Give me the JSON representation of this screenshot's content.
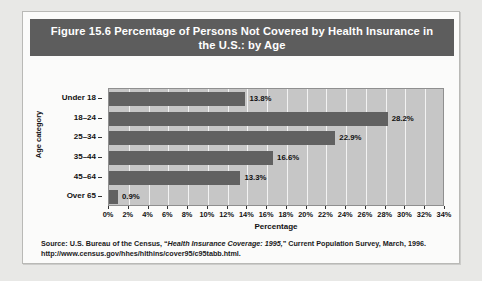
{
  "figure": {
    "title": "Figure 15.6  Percentage of Persons Not Covered by Health Insurance in the U.S.: by Age"
  },
  "source": {
    "prefix": "Source: U.S. Bureau of the Census, “",
    "italic": "Health Insurance Coverage: 1995,",
    "suffix": "” Current Population Survey, March, 1996.",
    "url": "http://www.census.gov/hhes/hlthins/cover95/c95tabb.html."
  },
  "colors": {
    "title_banner": "#5d5d5d",
    "bar": "#616161",
    "plot_background": "#c6c6c6",
    "gridline": "#f2f2f2",
    "panel_background": "#fbfbfa",
    "page_background": "#e8e8e6"
  },
  "chart_data": {
    "type": "bar",
    "orientation": "horizontal",
    "title": "Figure 15.6  Percentage of Persons Not Covered by Health Insurance in the U.S.: by Age",
    "xlabel": "Percentage",
    "ylabel": "Age category",
    "categories": [
      "Under 18",
      "18–24",
      "25–34",
      "35–44",
      "45–64",
      "Over 65"
    ],
    "values": [
      13.8,
      28.2,
      22.9,
      16.6,
      13.3,
      0.9
    ],
    "data_labels": [
      "13.8%",
      "28.2%",
      "22.9%",
      "16.6%",
      "13.3%",
      "0.9%"
    ],
    "xlim": [
      0,
      34
    ],
    "xticks": [
      0,
      2,
      4,
      6,
      8,
      10,
      12,
      14,
      16,
      18,
      20,
      22,
      24,
      26,
      28,
      30,
      32,
      34
    ],
    "xtick_labels": [
      "0%",
      "2%",
      "4%",
      "6%",
      "8%",
      "10%",
      "12%",
      "14%",
      "16%",
      "18%",
      "20%",
      "22%",
      "24%",
      "26%",
      "28%",
      "30%",
      "32%",
      "34%"
    ],
    "grid": "vertical",
    "legend": "none"
  }
}
